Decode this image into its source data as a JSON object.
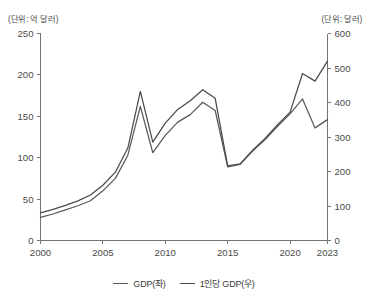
{
  "axes": {
    "left_unit": "(단위: 억 달러)",
    "right_unit": "(단위: 달러)"
  },
  "legend": {
    "items": [
      {
        "label": "GDP(좌)",
        "color": "#595959"
      },
      {
        "label": "1인당 GDP(우)",
        "color": "#4a4a4a"
      }
    ]
  },
  "chart_data": {
    "type": "line",
    "title": "",
    "xlabel": "",
    "ylabel": "",
    "grid": false,
    "legend_position": "bottom",
    "x": [
      2000,
      2001,
      2002,
      2003,
      2004,
      2005,
      2006,
      2007,
      2008,
      2009,
      2010,
      2011,
      2012,
      2013,
      2014,
      2015,
      2016,
      2017,
      2018,
      2019,
      2020,
      2021,
      2022,
      2023
    ],
    "xticks": [
      2000,
      2005,
      2010,
      2015,
      2020,
      2023
    ],
    "xtick_labels": [
      "2000",
      "2005",
      "2010",
      "2015",
      "2020",
      "2023"
    ],
    "xlim": [
      2000,
      2023
    ],
    "left_axis": {
      "label": "(단위: 억 달러)",
      "ylim": [
        0,
        250
      ],
      "yticks": [
        0,
        50,
        100,
        150,
        200,
        250
      ],
      "ytick_labels": [
        "0",
        "50",
        "100",
        "150",
        "200",
        "250"
      ]
    },
    "right_axis": {
      "label": "(단위: 달러)",
      "ylim": [
        0,
        600
      ],
      "yticks": [
        0,
        100,
        200,
        300,
        400,
        500,
        600
      ],
      "ytick_labels": [
        "0",
        "100",
        "200",
        "300",
        "400",
        "500",
        "600"
      ]
    },
    "series": [
      {
        "name": "GDP(좌)",
        "axis": "left",
        "unit": "억 달러",
        "color": "#595959",
        "values": [
          28,
          32,
          37,
          42,
          48,
          60,
          75,
          103,
          162,
          106,
          127,
          143,
          152,
          167,
          157,
          89,
          92,
          108,
          122,
          138,
          153,
          171,
          136,
          146
        ]
      },
      {
        "name": "1인당 GDP(우)",
        "axis": "right",
        "unit": "달러",
        "color": "#4a4a4a",
        "values": [
          80,
          90,
          102,
          115,
          132,
          160,
          198,
          268,
          432,
          285,
          340,
          380,
          405,
          437,
          412,
          216,
          222,
          262,
          296,
          336,
          372,
          484,
          462,
          520
        ]
      }
    ]
  }
}
